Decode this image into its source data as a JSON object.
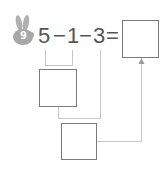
{
  "problem": {
    "number": "9",
    "badge_icon": "rabbit-icon",
    "badge_color": "#a8a8a8",
    "expression": {
      "operand1": "5",
      "op1": "−",
      "operand2": "1",
      "op2": "−",
      "operand3": "3",
      "equals": "="
    },
    "answer_box": {
      "value": ""
    },
    "step1_box": {
      "value": ""
    },
    "step2_box": {
      "value": ""
    }
  },
  "colors": {
    "text": "#555555",
    "box_border": "#7a7a7a",
    "connector": "#c6c6c6"
  }
}
